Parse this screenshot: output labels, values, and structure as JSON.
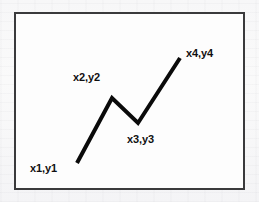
{
  "figure": {
    "background_color": "#fbfbfb",
    "plot_background_color": "#fdfdfd",
    "frame_color": "#3a3a3c",
    "line_color": "#0a0a0a",
    "label_color": "#101010"
  },
  "frame": {
    "x": 14,
    "y": 12,
    "width": 231,
    "height": 178,
    "stroke_width": 2
  },
  "chart_data": {
    "type": "line",
    "title": "",
    "subtitle": "",
    "xlabel": "",
    "ylabel": "",
    "grid": false,
    "legend": false,
    "axis_ticks": false,
    "series": [
      {
        "name": "polyline",
        "color": "#0a0a0a",
        "stroke_width": 4,
        "points": [
          {
            "label": "x1,y1",
            "px": 77,
            "py": 163
          },
          {
            "label": "x2,y2",
            "px": 112,
            "py": 98
          },
          {
            "label": "x3,y3",
            "px": 138,
            "py": 123
          },
          {
            "label": "x4,y4",
            "px": 180,
            "py": 58
          }
        ]
      }
    ],
    "annotations": [
      {
        "text": "x1,y1",
        "x": 30,
        "y": 172,
        "anchor": "start"
      },
      {
        "text": "x2,y2",
        "x": 73,
        "y": 81,
        "anchor": "start"
      },
      {
        "text": "x3,y3",
        "x": 127,
        "y": 143,
        "anchor": "start"
      },
      {
        "text": "x4,y4",
        "x": 186,
        "y": 57,
        "anchor": "start"
      }
    ]
  }
}
